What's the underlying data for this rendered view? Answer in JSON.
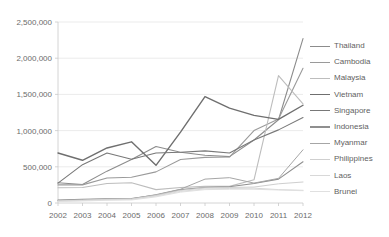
{
  "chart_data": {
    "type": "line",
    "title": "",
    "xlabel": "",
    "ylabel": "",
    "categories": [
      "2002",
      "2003",
      "2004",
      "2005",
      "2006",
      "2007",
      "2008",
      "2009",
      "2010",
      "2011",
      "2012"
    ],
    "ylim": [
      0,
      2500000
    ],
    "ytick_labels": [
      "0",
      "500,000",
      "1,000,000",
      "1,500,000",
      "2,000,000",
      "2,500,000"
    ],
    "ytick_values": [
      0,
      500000,
      1000000,
      1500000,
      2000000,
      2500000
    ],
    "grid": true,
    "legend_position": "right",
    "series": [
      {
        "name": "Thailand",
        "color": "#8c8c8c",
        "width": 1.1,
        "values": [
          280000,
          255000,
          440000,
          600000,
          780000,
          700000,
          660000,
          640000,
          870000,
          1150000,
          2270000
        ]
      },
      {
        "name": "Cambodia",
        "color": "#9a9a9a",
        "width": 1.1,
        "values": [
          250000,
          250000,
          345000,
          355000,
          430000,
          600000,
          630000,
          635000,
          1000000,
          1160000,
          1860000
        ]
      },
      {
        "name": "Malaysia",
        "color": "#bdbdbd",
        "width": 1.1,
        "values": [
          210000,
          215000,
          270000,
          280000,
          185000,
          215000,
          230000,
          230000,
          320000,
          1760000,
          1370000
        ]
      },
      {
        "name": "Vietnam",
        "color": "#6f6f6f",
        "width": 1.4,
        "values": [
          690000,
          590000,
          760000,
          845000,
          520000,
          980000,
          1470000,
          1310000,
          1210000,
          1155000,
          1350000
        ]
      },
      {
        "name": "Singapore",
        "color": "#787878",
        "width": 1.1,
        "values": [
          275000,
          530000,
          690000,
          605000,
          690000,
          700000,
          720000,
          690000,
          870000,
          1010000,
          1180000
        ]
      },
      {
        "name": "Indonesia",
        "color": "#8f8f8f",
        "width": 1.1,
        "values": [
          40000,
          50000,
          58000,
          60000,
          110000,
          185000,
          215000,
          225000,
          270000,
          330000,
          570000
        ]
      },
      {
        "name": "Myanmar",
        "color": "#a6a6a6",
        "width": 1.0,
        "values": [
          35000,
          45000,
          55000,
          58000,
          115000,
          190000,
          330000,
          350000,
          275000,
          340000,
          735000
        ]
      },
      {
        "name": "Philippines",
        "color": "#cfcfcf",
        "width": 1.0,
        "values": [
          30000,
          40000,
          50000,
          55000,
          105000,
          175000,
          210000,
          215000,
          220000,
          265000,
          290000
        ]
      },
      {
        "name": "Laos",
        "color": "#d8d8d8",
        "width": 1.0,
        "values": [
          25000,
          35000,
          45000,
          50000,
          95000,
          160000,
          195000,
          200000,
          205000,
          185000,
          175000
        ]
      },
      {
        "name": "Brunei",
        "color": "#e0e0e0",
        "width": 1.0,
        "values": [
          20000,
          28000,
          38000,
          42000,
          85000,
          150000,
          185000,
          190000,
          190000,
          180000,
          170000
        ]
      }
    ]
  },
  "legend": {
    "items": [
      {
        "label": "Thailand"
      },
      {
        "label": "Cambodia"
      },
      {
        "label": "Malaysia"
      },
      {
        "label": "Vietnam"
      },
      {
        "label": "Singapore"
      },
      {
        "label": "Indonesia"
      },
      {
        "label": "Myanmar"
      },
      {
        "label": "Philippines"
      },
      {
        "label": "Laos"
      },
      {
        "label": "Brunei"
      }
    ]
  }
}
